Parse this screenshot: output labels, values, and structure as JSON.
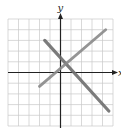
{
  "chart_data": {
    "type": "line",
    "title": "",
    "xlabel": "x",
    "ylabel": "y",
    "xlim": [
      -5,
      5
    ],
    "ylim": [
      -5,
      5
    ],
    "grid": true,
    "grid_step": 1,
    "tick_labels_shown": false,
    "legend": null,
    "series": [
      {
        "name": "falling line",
        "slope_approx": -1.1,
        "points": [
          [
            -1.5,
            3.0
          ],
          [
            4.6,
            -3.6
          ]
        ],
        "color": "#6e6e6e"
      },
      {
        "name": "rising line",
        "slope_approx": 0.87,
        "points": [
          [
            -2.0,
            -1.3
          ],
          [
            4.3,
            4.0
          ]
        ],
        "color": "#8a8a8a"
      }
    ],
    "intersection_approx": [
      1.0,
      1.2
    ]
  },
  "axes": {
    "x_label": "x",
    "y_label": "y"
  },
  "colors": {
    "grid": "#c8c8c8",
    "axis": "#222222",
    "line_dark": "#6e6e6e",
    "line_light": "#8a8a8a"
  }
}
